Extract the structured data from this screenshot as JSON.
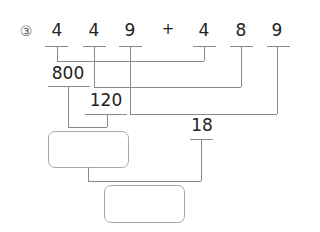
{
  "problem": {
    "number_label": "③",
    "expression": {
      "operand1_digits": [
        "4",
        "4",
        "9"
      ],
      "operator": "+",
      "operand2_digits": [
        "4",
        "8",
        "9"
      ]
    },
    "partial_sums": {
      "hundreds": "800",
      "tens": "120",
      "ones": "18"
    },
    "answer_boxes": {
      "intermediate": "",
      "final": ""
    }
  },
  "colors": {
    "text": "#222222",
    "lines": "#8a8a8a",
    "box_border": "#a8a8a8"
  }
}
